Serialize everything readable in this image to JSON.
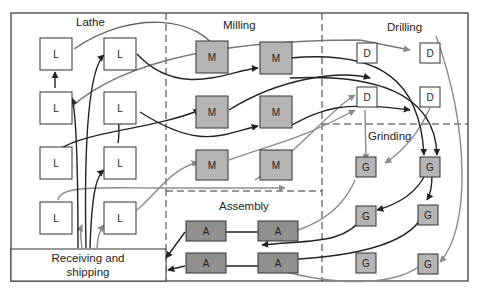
{
  "diagram": {
    "type": "process-layout-flow",
    "colors": {
      "background": "#ffffff",
      "border": "#333333",
      "dashed_divider": "#333333",
      "box_white": "#ffffff",
      "box_light_gray": "#b4b4b4",
      "box_dark_gray": "#8f8f8f",
      "flow_dark": "#222222",
      "flow_light": "#8a8a8a"
    },
    "departments": [
      {
        "id": "lathe",
        "label": "Lathe"
      },
      {
        "id": "milling",
        "label": "Milling"
      },
      {
        "id": "drilling",
        "label": "Drilling"
      },
      {
        "id": "grinding",
        "label": "Grinding"
      },
      {
        "id": "assembly",
        "label": "Assembly"
      },
      {
        "id": "receiving",
        "label_line1": "Receiving and",
        "label_line2": "shipping"
      }
    ],
    "machines": {
      "lathe": [
        "L",
        "L",
        "L",
        "L",
        "L",
        "L",
        "L",
        "L"
      ],
      "milling": [
        "M",
        "M",
        "M",
        "M",
        "M",
        "M"
      ],
      "drilling": [
        "D",
        "D",
        "D",
        "D"
      ],
      "grinding": [
        "G",
        "G",
        "G",
        "G",
        "G",
        "G"
      ],
      "assembly": [
        "A",
        "A",
        "A",
        "A"
      ]
    }
  }
}
